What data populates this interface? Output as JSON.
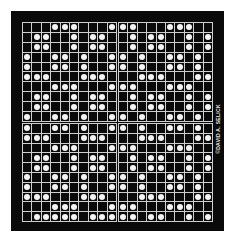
{
  "image": {
    "description": "Black square panel with a 20x20 white-line grid divided into four 10x10 quadrants; white dots fill selected cells forming a repeating pattern",
    "credit": "©DAVID A. SELICK",
    "colors": {
      "background": "#ffffff",
      "panel": "#0a0a0a",
      "grid_lines": "#cfcfcf",
      "dots": "#f4f4f4"
    }
  },
  "grid": {
    "rows": 20,
    "cols": 20,
    "dots_by_row": [
      [
        3,
        4,
        5,
        9,
        10,
        11,
        15,
        16,
        17
      ],
      [
        1,
        2,
        5,
        7,
        8,
        11,
        13,
        14,
        17,
        19
      ],
      [
        1,
        2,
        5,
        7,
        8,
        11,
        13,
        14,
        17,
        19
      ],
      [
        0,
        3,
        4,
        6,
        9,
        10,
        12,
        15,
        16,
        18
      ],
      [
        0,
        3,
        4,
        6,
        9,
        10,
        12,
        15,
        16,
        18
      ],
      [
        0,
        1,
        2,
        6,
        7,
        8,
        12,
        13,
        14,
        18,
        19
      ],
      [
        3,
        4,
        5,
        9,
        10,
        11,
        15,
        16,
        17
      ],
      [
        1,
        2,
        5,
        7,
        8,
        11,
        13,
        14,
        17,
        19
      ],
      [
        1,
        2,
        5,
        7,
        8,
        11,
        13,
        14,
        17,
        19
      ],
      [
        0,
        3,
        4,
        6,
        9,
        10,
        12,
        15,
        16,
        18
      ],
      [
        0,
        3,
        4,
        6,
        9,
        10,
        12,
        15,
        16,
        18
      ],
      [
        0,
        1,
        2,
        6,
        7,
        8,
        12,
        13,
        14,
        18,
        19
      ],
      [
        3,
        4,
        5,
        9,
        10,
        11,
        15,
        16,
        17
      ],
      [
        1,
        2,
        5,
        7,
        8,
        11,
        13,
        14,
        17,
        19
      ],
      [
        1,
        2,
        5,
        7,
        8,
        11,
        13,
        14,
        17,
        19
      ],
      [
        0,
        3,
        4,
        6,
        9,
        10,
        12,
        15,
        16,
        18
      ],
      [
        0,
        3,
        4,
        6,
        9,
        10,
        12,
        15,
        16,
        18
      ],
      [
        0,
        1,
        2,
        6,
        7,
        8,
        12,
        13,
        14,
        18,
        19
      ],
      [
        3,
        4,
        5,
        9,
        10,
        11,
        15,
        16,
        17
      ],
      [
        1,
        2,
        3,
        4,
        5,
        7,
        8,
        9,
        10,
        11,
        13,
        14,
        17,
        19
      ]
    ]
  }
}
